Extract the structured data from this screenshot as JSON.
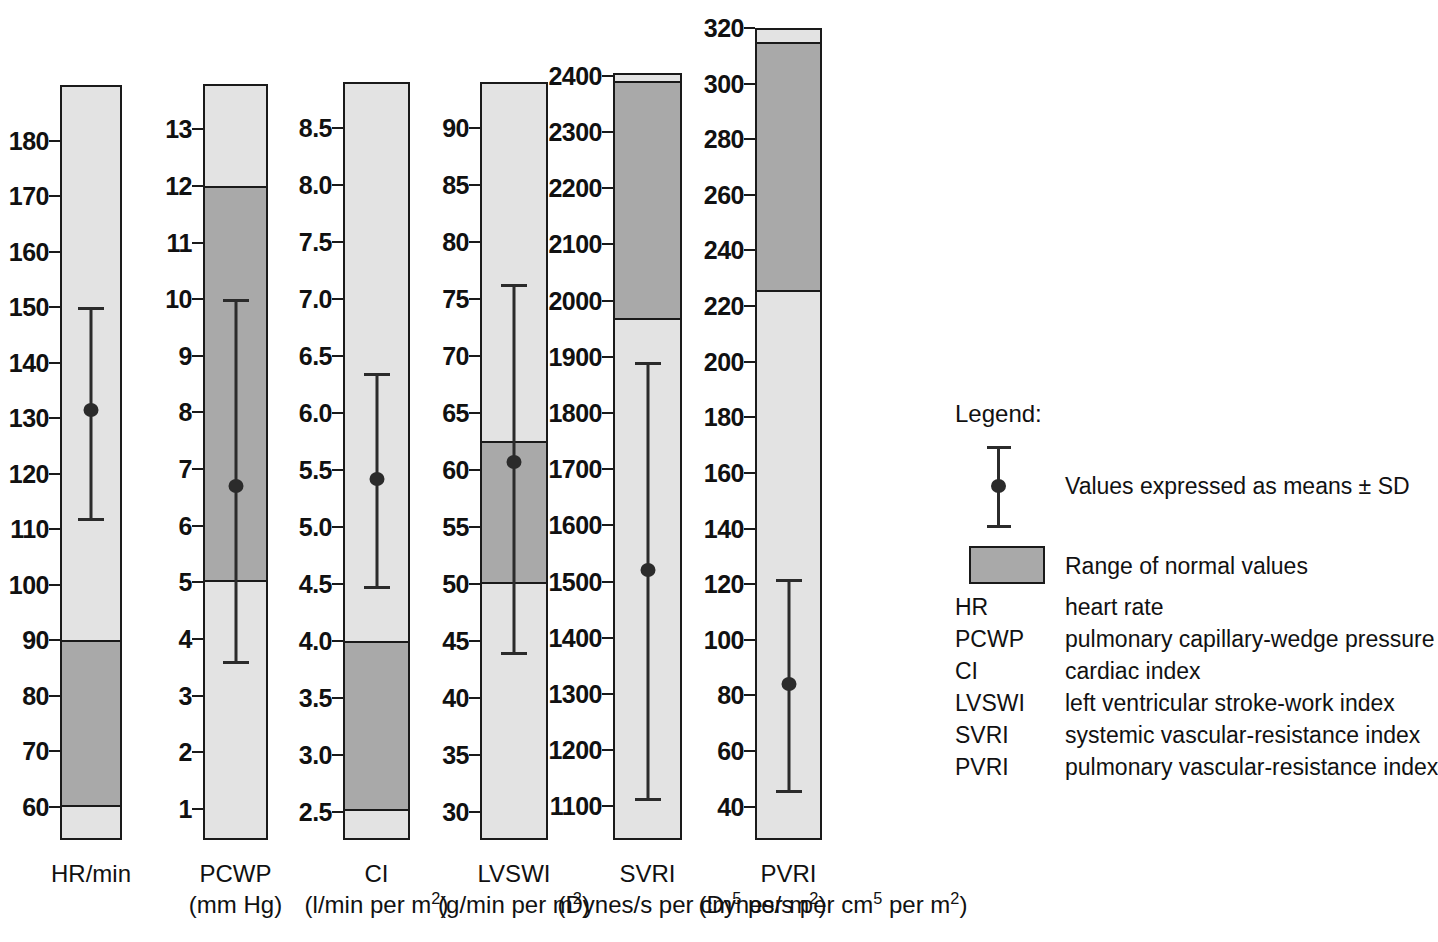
{
  "chart_data": {
    "type": "bar",
    "title": "",
    "subtitle": "",
    "xlabel": "",
    "ylabel": "",
    "grid": false,
    "legend_position": "right",
    "columns": [
      {
        "key": "HR",
        "name": "HR/min",
        "unit": "",
        "axis_min": 54,
        "axis_max": 190,
        "ticks": [
          180,
          170,
          160,
          150,
          140,
          130,
          120,
          110,
          100,
          90,
          80,
          70,
          60
        ],
        "tick_labels": [
          "180",
          "170",
          "160",
          "150",
          "140",
          "130",
          "120",
          "110",
          "100",
          "90",
          "80",
          "70",
          "60"
        ],
        "normal_low": 60,
        "normal_high": 90,
        "mean": 131.5,
        "sd_low": 111.5,
        "sd_high": 150.0
      },
      {
        "key": "PCWP",
        "name": "PCWP",
        "unit": "(mm Hg)",
        "axis_min": 0.45,
        "axis_max": 13.8,
        "ticks": [
          13,
          12,
          11,
          10,
          9,
          8,
          7,
          6,
          5,
          4,
          3,
          2,
          1
        ],
        "tick_labels": [
          "13",
          "12",
          "11",
          "10",
          "9",
          "8",
          "7",
          "6",
          "5",
          "4",
          "3",
          "2",
          "1"
        ],
        "normal_low": 5,
        "normal_high": 12,
        "mean": 6.7,
        "sd_low": 3.55,
        "sd_high": 10.0
      },
      {
        "key": "CI",
        "name": "CI",
        "unit": "(l/min per m<sup>2</sup>)",
        "axis_min": 2.25,
        "axis_max": 8.9,
        "ticks": [
          8.5,
          8.0,
          7.5,
          7.0,
          6.5,
          6.0,
          5.5,
          5.0,
          4.5,
          4.0,
          3.5,
          3.0,
          2.5
        ],
        "tick_labels": [
          "8.5",
          "8.0",
          "7.5",
          "7.0",
          "6.5",
          "6.0",
          "5.5",
          "5.0",
          "4.5",
          "4.0",
          "3.5",
          "3.0",
          "2.5"
        ],
        "normal_low": 2.5,
        "normal_high": 4.0,
        "mean": 5.42,
        "sd_low": 4.45,
        "sd_high": 6.35
      },
      {
        "key": "LVSWI",
        "name": "LVSWI",
        "unit": "(g/min per m<sup>2</sup>)",
        "axis_min": 27.5,
        "axis_max": 94,
        "ticks": [
          90,
          85,
          80,
          75,
          70,
          65,
          60,
          55,
          50,
          45,
          40,
          35,
          30
        ],
        "tick_labels": [
          "90",
          "85",
          "80",
          "75",
          "70",
          "65",
          "60",
          "55",
          "50",
          "45",
          "40",
          "35",
          "30"
        ],
        "normal_low": 50,
        "normal_high": 62.5,
        "mean": 60.7,
        "sd_low": 43.7,
        "sd_high": 76.3
      },
      {
        "key": "SVRI",
        "name": "SVRI",
        "unit": "(Dynes/s per cm<sup>5</sup> per m<sup>2</sup>)",
        "axis_min": 1040,
        "axis_max": 2405,
        "ticks": [
          2400,
          2300,
          2200,
          2100,
          2000,
          1900,
          1800,
          1700,
          1600,
          1500,
          1400,
          1300,
          1200,
          1100
        ],
        "tick_labels": [
          "2400",
          "2300",
          "2200",
          "2100",
          "2000",
          "1900",
          "1800",
          "1700",
          "1600",
          "1500",
          "1400",
          "1300",
          "1200",
          "1100"
        ],
        "normal_low": 1965,
        "normal_high": 2390,
        "mean": 1520,
        "sd_low": 1110,
        "sd_high": 1890
      },
      {
        "key": "PVRI",
        "name": "PVRI",
        "unit": "(Dynes/s per cm<sup>5</sup> per m<sup>2</sup>)",
        "axis_min": 28,
        "axis_max": 320,
        "ticks": [
          320,
          300,
          280,
          260,
          240,
          220,
          200,
          180,
          160,
          140,
          120,
          100,
          80,
          60,
          40
        ],
        "tick_labels": [
          "320",
          "300",
          "280",
          "260",
          "240",
          "220",
          "200",
          "180",
          "160",
          "140",
          "120",
          "100",
          "80",
          "60",
          "40"
        ],
        "normal_low": 225,
        "normal_high": 315,
        "mean": 84,
        "sd_low": 45,
        "sd_high": 122
      }
    ],
    "colors": {
      "normal_band": "#a9a9a9",
      "column_background": "#e3e3e3",
      "outline": "#1a1a1a",
      "marker": "#2b2b2b"
    }
  },
  "legend": {
    "title": "Legend:",
    "errorbar_label": "Values expressed as means ± SD",
    "band_label": "Range of normal values",
    "abbreviations": [
      {
        "key": "HR",
        "definition": "heart rate"
      },
      {
        "key": "PCWP",
        "definition": "pulmonary capillary-wedge pressure"
      },
      {
        "key": "CI",
        "definition": "cardiac index"
      },
      {
        "key": "LVSWI",
        "definition": "left ventricular stroke-work index"
      },
      {
        "key": "SVRI",
        "definition": "systemic vascular-resistance index"
      },
      {
        "key": "PVRI",
        "definition": "pulmonary vascular-resistance index"
      }
    ]
  }
}
